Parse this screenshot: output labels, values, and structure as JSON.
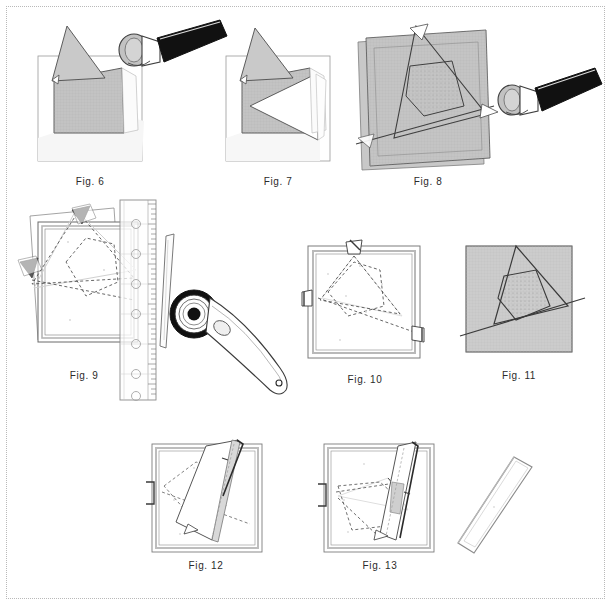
{
  "page": {
    "border_style": "dotted",
    "border_color": "#b9b9b9",
    "background_color": "#ffffff",
    "width": 613,
    "height": 607
  },
  "palette": {
    "fabric_light_gray": "#c9c9c9",
    "fabric_mid_gray": "#bdbdbd",
    "fabric_dark_gray": "#a8a8a8",
    "outline_dark": "#3a3a3a",
    "outline_mid": "#6e6e6e",
    "outline_light": "#bbbbbb",
    "handle_black": "#111111",
    "white": "#ffffff",
    "shadow_gray": "#e4e4e4"
  },
  "figures": [
    {
      "id": "fig-6",
      "caption": "Fig. 6",
      "description": "Folded fabric square on cutting mat with rotary cutter at upper right",
      "row": 1,
      "column": 1,
      "objects": [
        "cutting-mat",
        "folded-fabric",
        "triangle-flap",
        "rotary-cutter",
        "cutter-handle"
      ]
    },
    {
      "id": "fig-7",
      "caption": "Fig. 7",
      "description": "Folded fabric square with triangle flap opened to the right",
      "row": 1,
      "column": 2,
      "objects": [
        "cutting-mat",
        "folded-fabric",
        "triangle-flap",
        "open-flap"
      ]
    },
    {
      "id": "fig-8",
      "caption": "Fig. 8",
      "description": "Large fabric square with pentagon and triangle cut lines, rotary cutter at right",
      "row": 1,
      "column": 3,
      "objects": [
        "fabric-square",
        "pentagon-outline",
        "triangle-outline",
        "diagonal-cut-line",
        "rotary-cutter",
        "cutter-handle"
      ]
    },
    {
      "id": "fig-9",
      "caption": "Fig. 9",
      "description": "Fabric square with dashed construction lines, acrylic ruler and rotary cutter alongside",
      "row": 2,
      "column": 1,
      "objects": [
        "fabric-square",
        "dashed-pentagon",
        "dashed-triangle",
        "acrylic-ruler",
        "ruler-ticks",
        "ruler-holes",
        "rotary-cutter",
        "cutter-blade"
      ]
    },
    {
      "id": "fig-10",
      "caption": "Fig. 10",
      "description": "Framed fabric square showing dashed pentagon and diagonal guide lines with pins",
      "row": 2,
      "column": 2,
      "objects": [
        "fabric-frame",
        "dashed-pentagon",
        "diagonal-guide-line",
        "pin-top",
        "pin-left",
        "pin-right"
      ]
    },
    {
      "id": "fig-11",
      "caption": "Fig. 11",
      "description": "Shaded fabric square with solid pentagon and triangle seam lines",
      "row": 2,
      "column": 3,
      "objects": [
        "fabric-square",
        "pentagon-outline",
        "triangle-outline",
        "diagonal-line"
      ]
    },
    {
      "id": "fig-12",
      "caption": "Fig. 12",
      "description": "Fabric square with long folded strip laid diagonally across it",
      "row": 3,
      "column": 1,
      "objects": [
        "fabric-frame",
        "dashed-guides",
        "folded-strip",
        "pin-left",
        "pin-right"
      ]
    },
    {
      "id": "fig-13",
      "caption": "Fig. 13",
      "description": "Fabric square with strip folded back along the right edge revealing dashed lines",
      "row": 3,
      "column": 2,
      "objects": [
        "fabric-frame",
        "dashed-pentagon",
        "folded-back-strip",
        "pin-left",
        "pin-right"
      ]
    },
    {
      "id": "fig-strip",
      "caption": "",
      "description": "Detached narrow fabric strip",
      "row": 3,
      "column": 3,
      "objects": [
        "fabric-strip"
      ]
    }
  ]
}
